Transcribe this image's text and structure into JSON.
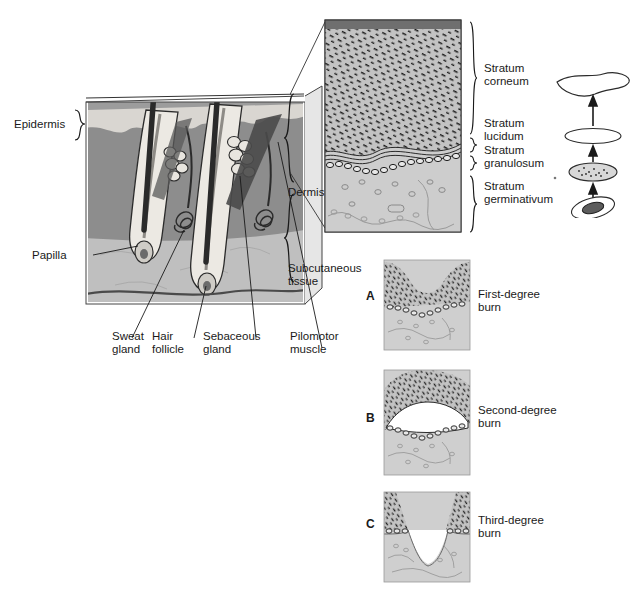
{
  "figure": {
    "type": "anatomical-diagram"
  },
  "main_section": {
    "name": "skin-cross-section",
    "labels": {
      "epidermis": "Epidermis",
      "dermis": "Dermis",
      "subcutaneous": "Subcutaneous\ntissue",
      "subcutaneous_line1": "Subcutaneous",
      "subcutaneous_line2": "tissue",
      "papilla": "Papilla",
      "sweat_gland_line1": "Sweat",
      "sweat_gland_line2": "gland",
      "hair_follicle_line1": "Hair",
      "hair_follicle_line2": "follicle",
      "sebaceous_line1": "Sebaceous",
      "sebaceous_line2": "gland",
      "pilomotor_line1": "Pilomotor",
      "pilomotor_line2": "muscle"
    }
  },
  "epidermis_detail": {
    "name": "epidermis-magnified",
    "layers": [
      {
        "id": "corneum",
        "line1": "Stratum",
        "line2": "corneum"
      },
      {
        "id": "lucidum",
        "line1": "Stratum",
        "line2": "lucidum"
      },
      {
        "id": "granulosum",
        "line1": "Stratum",
        "line2": "granulosum"
      },
      {
        "id": "germinativum",
        "line1": "Stratum",
        "line2": "germinativum"
      }
    ]
  },
  "cell_progression": {
    "name": "keratinocyte-maturation",
    "stages": [
      "flattened-squame",
      "flat-clear-cell",
      "granular-cell",
      "basal-cell-with-nucleus"
    ],
    "arrow_count": 3,
    "direction": "upward"
  },
  "burns": [
    {
      "letter": "A",
      "line1": "First-degree",
      "line2": "burn"
    },
    {
      "letter": "B",
      "line1": "Second-degree",
      "line2": "burn"
    },
    {
      "letter": "C",
      "line1": "Third-degree",
      "line2": "burn"
    }
  ],
  "colors": {
    "epidermis_light": "#d8d5d0",
    "dermis_dark": "#8d8d8d",
    "subcutaneous": "#bdbdbd",
    "corneum_fill": "#c3c3c3",
    "germinativum_fill": "#cccccc",
    "surface_dark": "#6f6f6f",
    "outline": "#2b2b2b",
    "text": "#1a1a1a"
  }
}
